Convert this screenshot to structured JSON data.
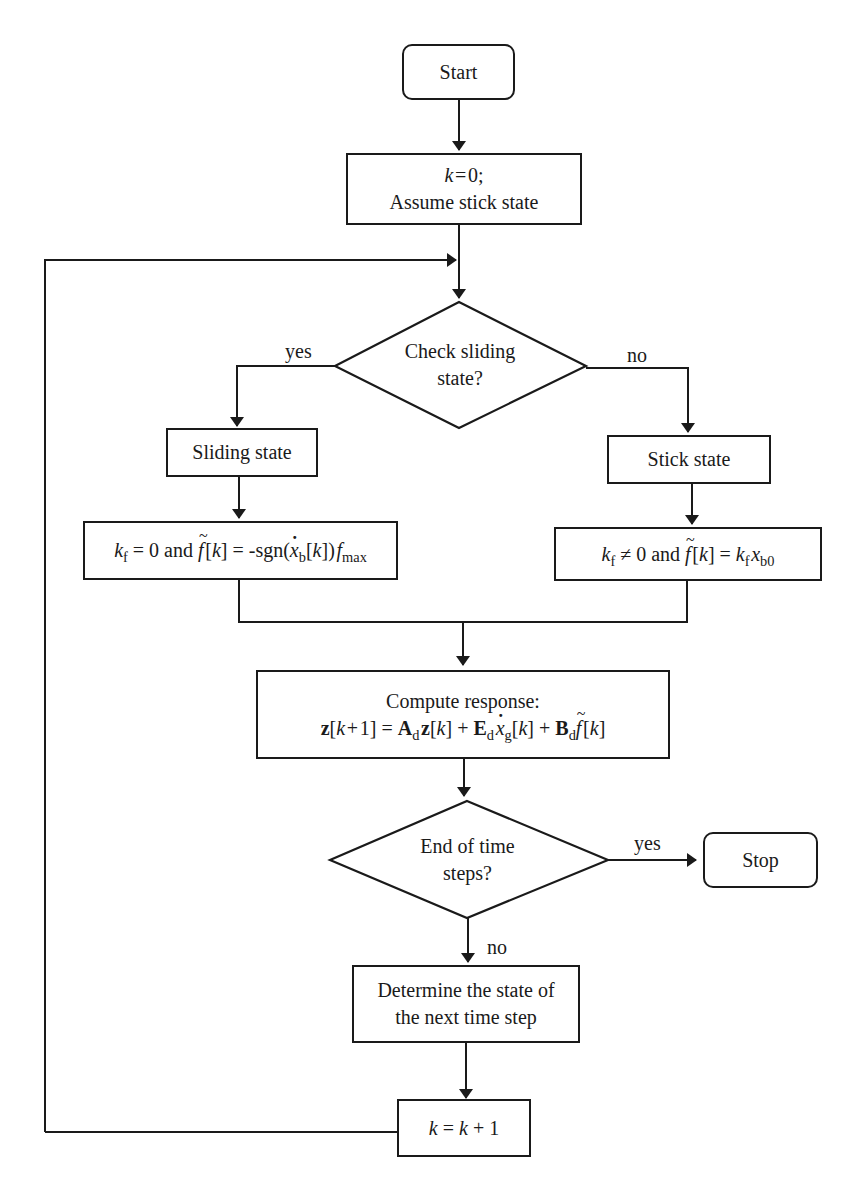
{
  "diagram": {
    "type": "flowchart",
    "nodes": {
      "start": {
        "label": "Start"
      },
      "init": {
        "line1": "k = 0;",
        "line2": "Assume stick state"
      },
      "check_sliding": {
        "line1": "Check sliding",
        "line2": "state?"
      },
      "sliding_state": {
        "label": "Sliding state"
      },
      "stick_state": {
        "label": "Stick state"
      },
      "sliding_formula": {
        "text": "k_f = 0 and f̃[k] = -sgn(ẋ_b[k]) f_max",
        "k": "k",
        "f_sub": "f",
        "eq0": " = 0 and ",
        "f": "f",
        "bracket_k": "[k]",
        "eq": " = -sgn(",
        "x": "x",
        "b_sub": "b",
        "close": "[k]) ",
        "fmax": "f",
        "max_sub": "max"
      },
      "stick_formula": {
        "text": "k_f ≠ 0 and f̃[k] = k_f x_b0",
        "k": "k",
        "f_sub": "f",
        "neq0": " ≠ 0 and ",
        "f": "f",
        "bracket_k": "[k]",
        "eq": " = ",
        "k2": "k",
        "f_sub2": "f",
        "x": "x",
        "b0_sub": "b0"
      },
      "compute": {
        "line1": "Compute response:",
        "text": "z[k + 1] = A_d z[k] + E_d ẋ_g[k] + B_d f̃[k]",
        "z": "z",
        "k1": "[k + 1]",
        "eq": " = ",
        "A": "A",
        "d": "d",
        "z2": "z",
        "k2": "[k]",
        "plus": " + ",
        "E": "E",
        "x": "x",
        "g": "g",
        "k3": "[k]",
        "B": "B",
        "f": "f",
        "k4": "[k]"
      },
      "end_check": {
        "line1": "End of time",
        "line2": "steps?"
      },
      "stop": {
        "label": "Stop"
      },
      "determine": {
        "line1": "Determine the state of",
        "line2": "the next time step"
      },
      "increment": {
        "text": "k = k + 1",
        "k": "k",
        "eq": " = ",
        "k2": "k",
        "plus1": " + 1"
      }
    },
    "edge_labels": {
      "sliding_yes": "yes",
      "sliding_no": "no",
      "end_yes": "yes",
      "end_no": "no"
    },
    "colors": {
      "stroke": "#1a1a1a",
      "background": "#ffffff"
    }
  }
}
